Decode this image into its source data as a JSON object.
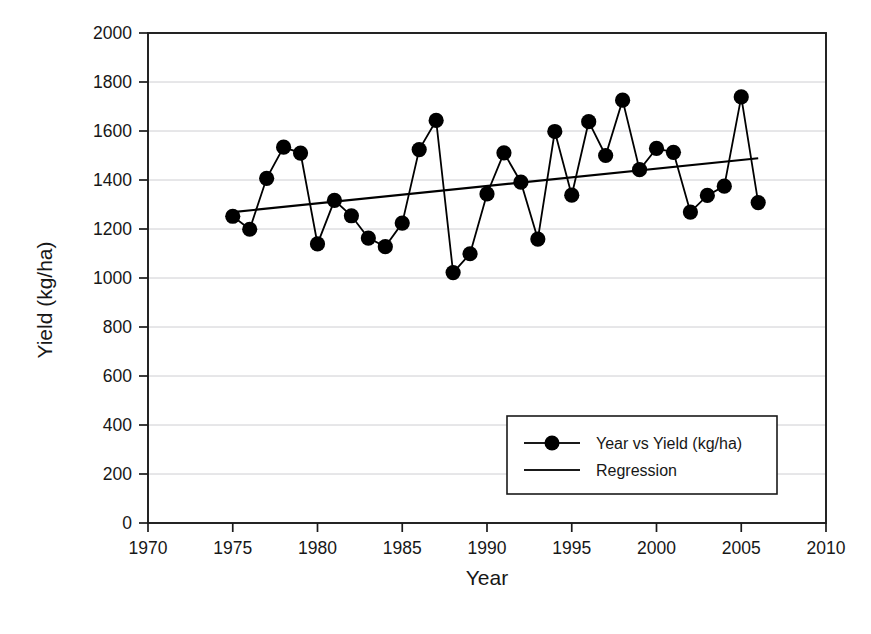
{
  "figure": {
    "caption": ""
  },
  "axes": {
    "x": {
      "label": "Year",
      "ticks": [
        "1970",
        "1975",
        "1980",
        "1985",
        "1990",
        "1995",
        "2000",
        "2005",
        "2010"
      ]
    },
    "y": {
      "label": "Yield (kg/ha)",
      "ticks": [
        "0",
        "200",
        "400",
        "600",
        "800",
        "1000",
        "1200",
        "1400",
        "1600",
        "1800",
        "2000"
      ]
    }
  },
  "legend": {
    "items": [
      {
        "label": "Year vs Yield (kg/ha)",
        "marker": "line-with-circle-marker",
        "color": "#000000"
      },
      {
        "label": "Regression",
        "marker": "plain-line",
        "color": "#000000"
      }
    ]
  },
  "chart_data": {
    "type": "line",
    "title": "",
    "xlabel": "Year",
    "ylabel": "Yield (kg/ha)",
    "xlim": [
      1970,
      2010
    ],
    "ylim": [
      0,
      2000
    ],
    "xticks": [
      1970,
      1975,
      1980,
      1985,
      1990,
      1995,
      2000,
      2005,
      2010
    ],
    "yticks": [
      0,
      200,
      400,
      600,
      800,
      1000,
      1200,
      1400,
      1600,
      1800,
      2000
    ],
    "grid": "horizontal",
    "legend_position": "lower-right-inside",
    "x": [
      1975,
      1976,
      1977,
      1978,
      1979,
      1980,
      1981,
      1982,
      1983,
      1984,
      1985,
      1986,
      1987,
      1988,
      1989,
      1990,
      1991,
      1992,
      1993,
      1994,
      1995,
      1996,
      1997,
      1998,
      1999,
      2000,
      2001,
      2002,
      2003,
      2004,
      2005,
      2006
    ],
    "series": [
      {
        "name": "Year vs Yield (kg/ha)",
        "marker": "circle",
        "color": "#000000",
        "values": [
          1252,
          1199,
          1407,
          1534,
          1510,
          1139,
          1317,
          1254,
          1163,
          1128,
          1224,
          1524,
          1643,
          1022,
          1099,
          1343,
          1511,
          1391,
          1159,
          1598,
          1338,
          1638,
          1500,
          1726,
          1442,
          1529,
          1513,
          1269,
          1337,
          1375,
          1739,
          1308
        ]
      },
      {
        "name": "Regression",
        "marker": "none",
        "color": "#000000",
        "endpoints": [
          {
            "x": 1975,
            "y": 1269
          },
          {
            "x": 2006,
            "y": 1489
          }
        ]
      }
    ]
  }
}
